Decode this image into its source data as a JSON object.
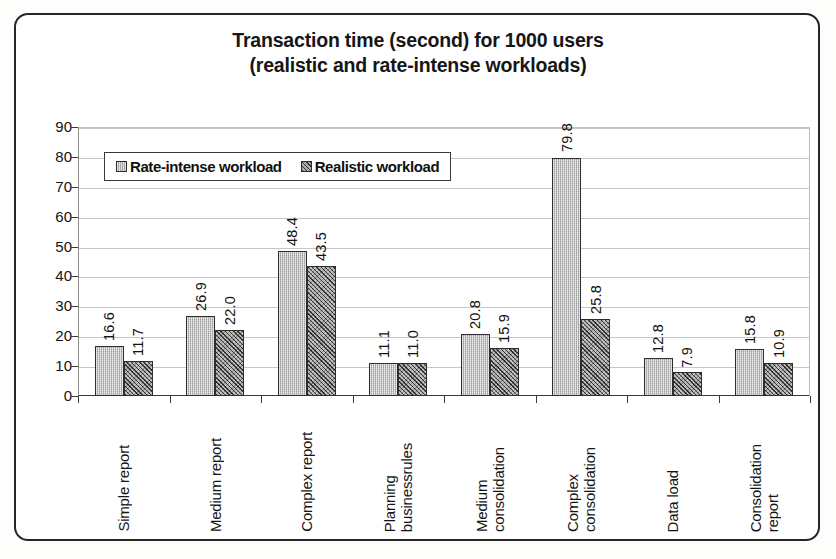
{
  "chart_data": {
    "type": "bar",
    "title": "Transaction time (second) for 1000 users\n(realistic and rate-intense workloads)",
    "title_line1": "Transaction time (second) for 1000 users",
    "title_line2": "(realistic and rate-intense workloads)",
    "xlabel": "",
    "ylabel": "",
    "ylim": [
      0,
      90
    ],
    "ytick_step": 10,
    "grid": true,
    "legend_position": "top-left inside plot",
    "categories": [
      "Simple report",
      "Medium report",
      "Complex report",
      "Planning\nbusinessrules",
      "Medium\nconsolidation",
      "Complex\nconsolidation",
      "Data load",
      "Consolidation\nreport"
    ],
    "ytick_labels": [
      "90",
      "80",
      "70",
      "60",
      "50",
      "40",
      "30",
      "20",
      "10",
      "0"
    ],
    "series": [
      {
        "name": "Rate-intense workload",
        "color": "#b9b9b9",
        "pattern": "fine-vertical-texture",
        "values": [
          16.6,
          26.9,
          48.4,
          11.1,
          20.8,
          79.8,
          12.8,
          15.8
        ],
        "labels": [
          "16.6",
          "26.9",
          "48.4",
          "11.1",
          "20.8",
          "79.8",
          "12.8",
          "15.8"
        ]
      },
      {
        "name": "Realistic workload",
        "color": "#7e7e7e",
        "pattern": "diagonal-crosshatch",
        "values": [
          11.7,
          22.0,
          43.5,
          11.0,
          15.9,
          25.8,
          7.9,
          10.9
        ],
        "labels": [
          "11.7",
          "22.0",
          "43.5",
          "11.0",
          "15.9",
          "25.8",
          "7.9",
          "10.9"
        ]
      }
    ]
  }
}
